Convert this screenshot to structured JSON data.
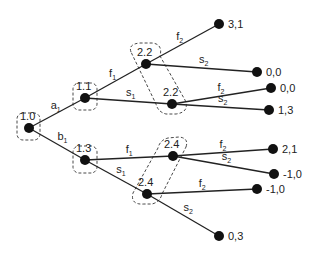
{
  "diagram": {
    "type": "extensive-form game tree",
    "nodes": [
      {
        "id": "root",
        "label": "1.0",
        "x": 29,
        "y": 128,
        "player": 1
      },
      {
        "id": "n11",
        "label": "1.1",
        "x": 85,
        "y": 98,
        "player": 1
      },
      {
        "id": "n13",
        "label": "1.3",
        "x": 85,
        "y": 160,
        "player": 1
      },
      {
        "id": "n22a",
        "label": "2.2",
        "x": 146,
        "y": 64,
        "player": 2
      },
      {
        "id": "n22b",
        "label": "2.2",
        "x": 172,
        "y": 104,
        "player": 2
      },
      {
        "id": "n24a",
        "label": "2.4",
        "x": 173,
        "y": 156,
        "player": 2
      },
      {
        "id": "n24b",
        "label": "2.4",
        "x": 147,
        "y": 194,
        "player": 2
      }
    ],
    "terminals": [
      {
        "id": "t1",
        "payoff": "3,1",
        "x": 219,
        "y": 24
      },
      {
        "id": "t2",
        "payoff": "0,0",
        "x": 257,
        "y": 72
      },
      {
        "id": "t3",
        "payoff": "0,0",
        "x": 271,
        "y": 88
      },
      {
        "id": "t4",
        "payoff": "1,3",
        "x": 269,
        "y": 110
      },
      {
        "id": "t5",
        "payoff": "2,1",
        "x": 273,
        "y": 149
      },
      {
        "id": "t6",
        "payoff": "-1,0",
        "x": 274,
        "y": 174
      },
      {
        "id": "t7",
        "payoff": "-1,0",
        "x": 257,
        "y": 189
      },
      {
        "id": "t8",
        "payoff": "0,3",
        "x": 219,
        "y": 236
      }
    ],
    "edges": [
      {
        "from": "root",
        "to": "n11",
        "action": "a",
        "sub": "1"
      },
      {
        "from": "root",
        "to": "n13",
        "action": "b",
        "sub": "1"
      },
      {
        "from": "n11",
        "to": "n22a",
        "action": "f",
        "sub": "1"
      },
      {
        "from": "n11",
        "to": "n22b",
        "action": "s",
        "sub": "1"
      },
      {
        "from": "n13",
        "to": "n24a",
        "action": "f",
        "sub": "1"
      },
      {
        "from": "n13",
        "to": "n24b",
        "action": "s",
        "sub": "1"
      },
      {
        "from": "n22a",
        "to": "t1",
        "action": "f",
        "sub": "2"
      },
      {
        "from": "n22a",
        "to": "t2",
        "action": "s",
        "sub": "2"
      },
      {
        "from": "n22b",
        "to": "t3",
        "action": "f",
        "sub": "2"
      },
      {
        "from": "n22b",
        "to": "t4",
        "action": "s",
        "sub": "2"
      },
      {
        "from": "n24a",
        "to": "t5",
        "action": "f",
        "sub": "2"
      },
      {
        "from": "n24a",
        "to": "t6",
        "action": "s",
        "sub": "2"
      },
      {
        "from": "n24b",
        "to": "t7",
        "action": "f",
        "sub": "2"
      },
      {
        "from": "n24b",
        "to": "t8",
        "action": "s",
        "sub": "2"
      }
    ],
    "information_sets": [
      {
        "label": "1.0",
        "members": [
          "root"
        ]
      },
      {
        "label": "1.1",
        "members": [
          "n11"
        ]
      },
      {
        "label": "1.3",
        "members": [
          "n13"
        ]
      },
      {
        "label": "2.2",
        "members": [
          "n22a",
          "n22b"
        ]
      },
      {
        "label": "2.4",
        "members": [
          "n24a",
          "n24b"
        ]
      }
    ]
  }
}
